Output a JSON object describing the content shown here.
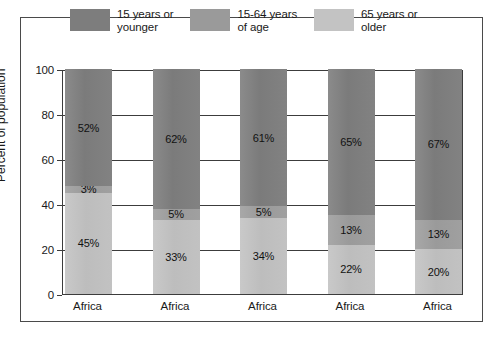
{
  "chart_data": {
    "type": "bar",
    "subtype": "stacked-column-100",
    "title": "",
    "xlabel": "",
    "ylabel": "Percent of population",
    "ylim": [
      0,
      100
    ],
    "yticks": [
      0,
      20,
      40,
      60,
      80,
      100
    ],
    "grid": true,
    "legend_position": "top",
    "categories": [
      "Africa",
      "Africa",
      "Africa",
      "Africa",
      "Africa"
    ],
    "series": [
      {
        "name": "15 years or younger",
        "legend_label": "15 years or\nyounger",
        "color": "#7d7d7d",
        "values": [
          45,
          33,
          34,
          22,
          20
        ],
        "labels": [
          "45%",
          "33%",
          "34%",
          "22%",
          "20%"
        ]
      },
      {
        "name": "15-64 years of age",
        "legend_label": "15-64 years\nof age",
        "color": "#9a9a9a",
        "values": [
          3,
          5,
          5,
          13,
          13
        ],
        "labels": [
          "3%",
          "5%",
          "5%",
          "13%",
          "13%"
        ]
      },
      {
        "name": "65 years or older",
        "legend_label": "65 years or\nolder",
        "color": "#c3c3c3",
        "values": [
          52,
          62,
          61,
          65,
          67
        ],
        "labels": [
          "52%",
          "62%",
          "61%",
          "65%",
          "67%"
        ]
      }
    ],
    "stacks": [
      {
        "category": "Africa",
        "segments": [
          {
            "series": "65 years or older",
            "value": 52,
            "label": "52%",
            "tone": "dark"
          },
          {
            "series": "15-64 years of age",
            "value": 3,
            "label": "3%",
            "tone": "mid"
          },
          {
            "series": "15 years or younger",
            "value": 45,
            "label": "45%",
            "tone": "light"
          }
        ]
      },
      {
        "category": "Africa",
        "segments": [
          {
            "series": "65 years or older",
            "value": 62,
            "label": "62%",
            "tone": "dark"
          },
          {
            "series": "15-64 years of age",
            "value": 5,
            "label": "5%",
            "tone": "mid"
          },
          {
            "series": "15 years or younger",
            "value": 33,
            "label": "33%",
            "tone": "light"
          }
        ]
      },
      {
        "category": "Africa",
        "segments": [
          {
            "series": "65 years or older",
            "value": 61,
            "label": "61%",
            "tone": "dark"
          },
          {
            "series": "15-64 years of age",
            "value": 5,
            "label": "5%",
            "tone": "mid"
          },
          {
            "series": "15 years or younger",
            "value": 34,
            "label": "34%",
            "tone": "light"
          }
        ]
      },
      {
        "category": "Africa",
        "segments": [
          {
            "series": "65 years or older",
            "value": 65,
            "label": "65%",
            "tone": "dark"
          },
          {
            "series": "15-64 years of age",
            "value": 13,
            "label": "13%",
            "tone": "mid"
          },
          {
            "series": "15 years or younger",
            "value": 22,
            "label": "22%",
            "tone": "light"
          }
        ]
      },
      {
        "category": "Africa",
        "segments": [
          {
            "series": "65 years or older",
            "value": 67,
            "label": "67%",
            "tone": "dark"
          },
          {
            "series": "15-64 years of age",
            "value": 13,
            "label": "13%",
            "tone": "mid"
          },
          {
            "series": "15 years or younger",
            "value": 20,
            "label": "20%",
            "tone": "light"
          }
        ]
      }
    ]
  },
  "legend": {
    "items": [
      {
        "label": "15 years or\nyounger",
        "color": "#7d7d7d"
      },
      {
        "label": "15-64 years\nof age",
        "color": "#9a9a9a"
      },
      {
        "label": "65 years or\nolder",
        "color": "#c3c3c3"
      }
    ]
  },
  "axes": {
    "y_title": "Percent of population",
    "y_ticks": [
      "100",
      "80",
      "60",
      "40",
      "20",
      "0"
    ],
    "x_ticks": [
      "Africa",
      "Africa",
      "Africa",
      "Africa",
      "Africa"
    ]
  }
}
